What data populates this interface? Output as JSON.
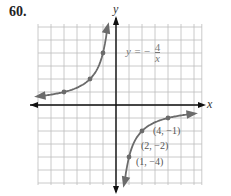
{
  "problem_number": "60.",
  "equation": {
    "lhs": "y =",
    "sign": "−",
    "numerator": "4",
    "denominator": "x"
  },
  "axes": {
    "x_label": "x",
    "y_label": "y"
  },
  "point_labels": [
    "(4, −1)",
    "(2, −2)",
    "(1, −4)"
  ],
  "chart_data": {
    "type": "line",
    "xlabel": "x",
    "ylabel": "y",
    "xlim": [
      -6,
      6
    ],
    "ylim": [
      -6,
      6
    ],
    "grid": true,
    "series": [
      {
        "name": "left branch",
        "x": [
          -6,
          -4,
          -2,
          -1,
          -0.67
        ],
        "y": [
          0.67,
          1,
          2,
          4,
          6
        ],
        "marked_points": [
          [
            -4,
            1
          ],
          [
            -2,
            2
          ],
          [
            -1,
            4
          ]
        ]
      },
      {
        "name": "right branch",
        "x": [
          0.67,
          1,
          2,
          4,
          6
        ],
        "y": [
          -6,
          -4,
          -2,
          -1,
          -0.67
        ],
        "marked_points": [
          [
            1,
            -4
          ],
          [
            2,
            -2
          ],
          [
            4,
            -1
          ]
        ]
      }
    ],
    "annotations": [
      "(4, −1)",
      "(2, −2)",
      "(1, −4)"
    ],
    "colors": {
      "curve": "#6b6b6b",
      "grid": "#bdbdbd",
      "axis": "#111111"
    }
  }
}
